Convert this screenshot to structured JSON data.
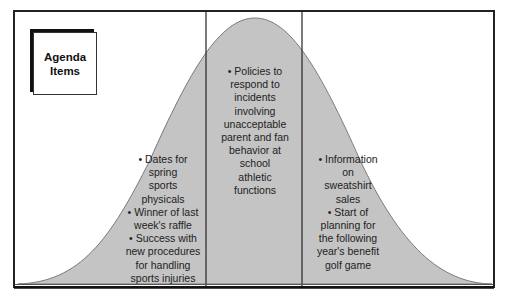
{
  "title_box": {
    "line1": "Agenda",
    "line2": "Items"
  },
  "colors": {
    "curve_fill": "#c4c4c4",
    "curve_stroke": "#7a7a7a",
    "frame": "#222222",
    "divider": "#333333"
  },
  "columns": {
    "left": {
      "lines": [
        "• Dates for",
        "spring",
        "sports",
        "physicals",
        "• Winner of last",
        "week's raffle",
        "• Success with",
        "new procedures",
        "for handling",
        "sports injuries"
      ]
    },
    "middle": {
      "lines": [
        "• Policies to",
        "respond to",
        "incidents",
        "involving",
        "unacceptable",
        "parent and fan",
        "behavior at",
        "school",
        "athletic",
        "functions"
      ]
    },
    "right": {
      "lines": [
        "• Information",
        "on",
        "sweatshirt",
        "sales",
        "• Start of",
        "planning for",
        "the following",
        "year's benefit",
        "golf game"
      ]
    }
  }
}
